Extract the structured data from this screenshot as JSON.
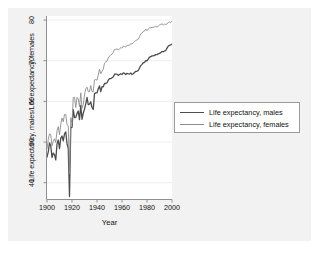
{
  "figure": {
    "background_color": "#ffffff",
    "frame_color": "#f2f2f2",
    "plot_background": "#ffffff"
  },
  "legend": {
    "entries": [
      {
        "label": "Life expectancy, males",
        "color": "#4d4d4d",
        "width": 1.3
      },
      {
        "label": "Life expectancy, females",
        "color": "#8c8c8c",
        "width": 0.9
      }
    ]
  },
  "chart_data": {
    "type": "line",
    "title": "",
    "xlabel": "Year",
    "ylabel": "Life expectancy, males/Life expectancy, females",
    "xlim": [
      1900,
      2000
    ],
    "ylim": [
      36,
      81
    ],
    "xticks": [
      1900,
      1920,
      1940,
      1960,
      1980,
      2000
    ],
    "yticks": [
      40,
      50,
      60,
      70,
      80
    ],
    "grid": true,
    "grid_axis": "y",
    "legend_position": "right",
    "x": [
      1900,
      1901,
      1902,
      1903,
      1904,
      1905,
      1906,
      1907,
      1908,
      1909,
      1910,
      1911,
      1912,
      1913,
      1914,
      1915,
      1916,
      1917,
      1918,
      1919,
      1920,
      1921,
      1922,
      1923,
      1924,
      1925,
      1926,
      1927,
      1928,
      1929,
      1930,
      1931,
      1932,
      1933,
      1934,
      1935,
      1936,
      1937,
      1938,
      1939,
      1940,
      1941,
      1942,
      1943,
      1944,
      1945,
      1946,
      1947,
      1948,
      1949,
      1950,
      1951,
      1952,
      1953,
      1954,
      1955,
      1956,
      1957,
      1958,
      1959,
      1960,
      1961,
      1962,
      1963,
      1964,
      1965,
      1966,
      1967,
      1968,
      1969,
      1970,
      1971,
      1972,
      1973,
      1974,
      1975,
      1976,
      1977,
      1978,
      1979,
      1980,
      1981,
      1982,
      1983,
      1984,
      1985,
      1986,
      1987,
      1988,
      1989,
      1990,
      1991,
      1992,
      1993,
      1994,
      1995,
      1996,
      1997,
      1998,
      1999,
      2000
    ],
    "series": [
      {
        "name": "Life expectancy, males",
        "color": "#4d4d4d",
        "values": [
          46.3,
          47.6,
          49.8,
          49.1,
          46.2,
          47.3,
          46.9,
          45.6,
          49.5,
          50.5,
          48.4,
          50.9,
          51.5,
          50.3,
          52.0,
          52.5,
          49.6,
          48.4,
          36.6,
          53.5,
          53.6,
          58.0,
          56.0,
          56.1,
          57.0,
          57.6,
          55.5,
          59.0,
          55.6,
          57.1,
          58.1,
          59.4,
          61.0,
          59.2,
          59.3,
          59.9,
          58.5,
          58.0,
          61.9,
          62.1,
          62.1,
          63.1,
          63.8,
          62.4,
          63.6,
          63.6,
          64.4,
          64.4,
          64.6,
          65.2,
          65.6,
          65.6,
          65.8,
          66.0,
          66.7,
          66.7,
          66.7,
          66.4,
          66.6,
          66.8,
          66.6,
          67.0,
          66.9,
          66.6,
          66.9,
          66.8,
          66.7,
          67.0,
          66.6,
          66.8,
          67.1,
          67.4,
          67.4,
          67.6,
          68.2,
          68.8,
          69.1,
          69.5,
          69.6,
          70.0,
          70.0,
          70.4,
          70.9,
          71.0,
          71.2,
          71.2,
          71.3,
          71.5,
          71.5,
          71.7,
          71.8,
          72.0,
          72.3,
          72.2,
          72.4,
          72.5,
          73.1,
          73.6,
          73.8,
          73.9,
          74.1
        ]
      },
      {
        "name": "Life expectancy, females",
        "color": "#8c8c8c",
        "values": [
          48.3,
          50.6,
          52.0,
          51.8,
          49.1,
          50.2,
          50.8,
          49.9,
          52.8,
          53.8,
          51.8,
          54.4,
          55.9,
          55.0,
          56.8,
          56.8,
          54.3,
          54.0,
          42.2,
          56.0,
          54.6,
          61.0,
          61.0,
          58.5,
          61.0,
          60.6,
          58.7,
          62.1,
          58.3,
          59.3,
          61.6,
          63.1,
          63.5,
          62.4,
          62.4,
          63.9,
          62.4,
          62.4,
          65.3,
          65.4,
          65.2,
          66.5,
          67.9,
          66.8,
          67.4,
          67.9,
          69.4,
          69.7,
          69.9,
          70.7,
          71.1,
          71.4,
          71.6,
          72.0,
          72.8,
          72.8,
          72.9,
          72.7,
          72.9,
          73.2,
          73.1,
          73.6,
          73.5,
          73.4,
          73.7,
          73.8,
          73.8,
          74.2,
          74.1,
          74.4,
          74.7,
          75.0,
          75.1,
          75.3,
          75.9,
          76.6,
          76.8,
          77.2,
          77.3,
          77.8,
          77.4,
          77.8,
          78.1,
          78.1,
          78.2,
          78.2,
          78.3,
          78.4,
          78.3,
          78.5,
          78.8,
          78.9,
          79.1,
          78.8,
          79.0,
          78.9,
          79.1,
          79.4,
          79.5,
          79.4,
          79.7
        ]
      }
    ]
  }
}
